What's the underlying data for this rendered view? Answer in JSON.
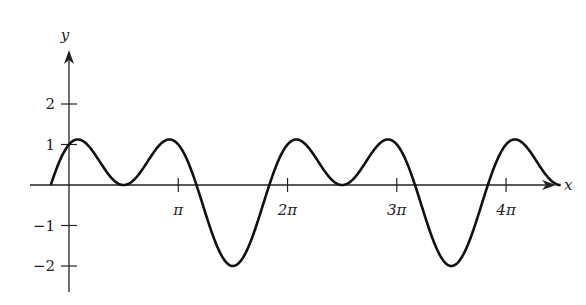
{
  "chart_data": {
    "type": "line",
    "title": "",
    "function": "y = sin(x) + cos(2x)",
    "xlabel": "x",
    "ylabel": "y",
    "x_domain": [
      -0.5236,
      14.1372
    ],
    "xlim": [
      -0.75,
      14.6
    ],
    "ylim": [
      -2.7,
      3.0
    ],
    "x_ticks": [
      {
        "value": 3.14159,
        "label": "π"
      },
      {
        "value": 6.28319,
        "label": "2π"
      },
      {
        "value": 9.42478,
        "label": "3π"
      },
      {
        "value": 12.56637,
        "label": "4π"
      }
    ],
    "y_ticks": [
      {
        "value": 2,
        "label": "2"
      },
      {
        "value": 1,
        "label": "1"
      },
      {
        "value": -1,
        "label": "−1"
      },
      {
        "value": -2,
        "label": "−2"
      }
    ],
    "key_points": [
      {
        "x": -0.5236,
        "y": 0
      },
      {
        "x": 0.2527,
        "y": 1.125
      },
      {
        "x": 1.5708,
        "y": 0
      },
      {
        "x": 2.8889,
        "y": 1.125
      },
      {
        "x": 4.7124,
        "y": -2
      },
      {
        "x": 6.5359,
        "y": 1.125
      },
      {
        "x": 7.854,
        "y": 0
      },
      {
        "x": 9.1721,
        "y": 1.125
      },
      {
        "x": 10.9956,
        "y": -2
      },
      {
        "x": 12.8191,
        "y": 1.125
      },
      {
        "x": 14.1372,
        "y": 0
      }
    ],
    "grid": false,
    "legend": null,
    "colors": {
      "curve": "#111111",
      "axes": "#222222"
    }
  },
  "layout": {
    "origin_px": [
      69,
      185
    ],
    "px_per_x_unit": 34.78,
    "px_per_y_unit": 40.5,
    "x_axis_px": [
      30,
      556
    ],
    "y_axis_px": [
      50,
      292
    ]
  }
}
